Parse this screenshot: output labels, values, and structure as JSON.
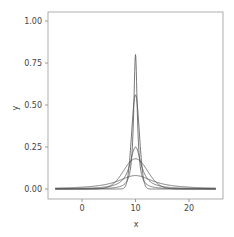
{
  "chart_data": {
    "type": "line",
    "title": "",
    "xlabel": "x",
    "ylabel": "y",
    "xlim": [
      -5,
      25
    ],
    "ylim": [
      0,
      1.0
    ],
    "x_ticks": [
      "0",
      "10",
      "20"
    ],
    "y_ticks": [
      "0.00",
      "0.25",
      "0.50",
      "0.75",
      "1.00"
    ],
    "grid": false,
    "legend": null,
    "series": [
      {
        "name": "curve-1",
        "center": 10,
        "peak": 0.8,
        "kind": "cauchy"
      },
      {
        "name": "curve-2",
        "center": 10,
        "peak": 0.56,
        "kind": "normal"
      },
      {
        "name": "curve-3",
        "center": 10,
        "peak": 0.25,
        "kind": "cauchy"
      },
      {
        "name": "curve-4",
        "center": 10,
        "peak": 0.18,
        "kind": "normal"
      },
      {
        "name": "curve-5",
        "center": 10,
        "peak": 0.08,
        "kind": "cauchy"
      }
    ]
  }
}
